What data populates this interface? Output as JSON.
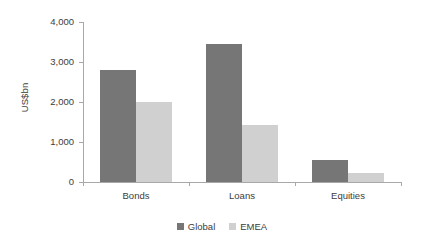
{
  "chart_data": {
    "type": "bar",
    "title": "",
    "subtitle": "",
    "xlabel": "",
    "ylabel": "US$bn",
    "categories": [
      "Bonds",
      "Loans",
      "Equities"
    ],
    "series": [
      {
        "name": "Global",
        "color": "#767676",
        "values": [
          2800,
          3450,
          550
        ]
      },
      {
        "name": "EMEA",
        "color": "#d0d0d0",
        "values": [
          2000,
          1420,
          225
        ]
      }
    ],
    "ylim": [
      0,
      4000
    ],
    "yticks": [
      0,
      1000,
      2000,
      3000,
      4000
    ],
    "ytick_labels": [
      "0",
      "1,000",
      "2,000",
      "3,000",
      "4,000"
    ],
    "grid": false,
    "legend_position": "bottom"
  },
  "axes": {
    "y_title": "US$bn",
    "axis_color": "#a8a8a8",
    "text_color": "#3c3c3c"
  },
  "legend": {
    "items": [
      {
        "label": "Global",
        "color": "#767676"
      },
      {
        "label": "EMEA",
        "color": "#d0d0d0"
      }
    ]
  }
}
